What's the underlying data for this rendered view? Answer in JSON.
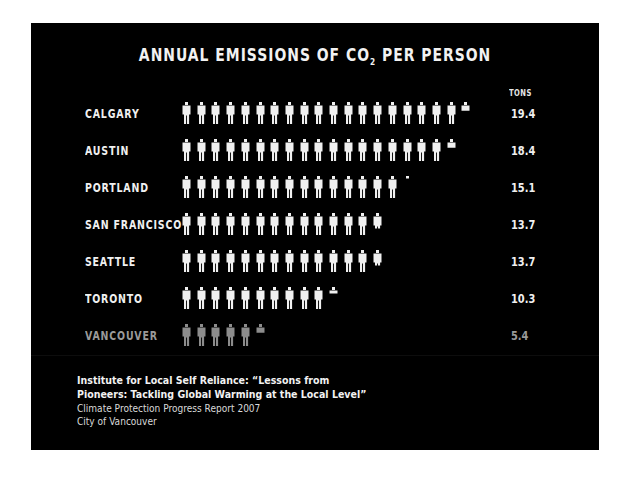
{
  "title": {
    "prefix": "ANNUAL EMISSIONS OF CO",
    "subscript": "2",
    "suffix": " PER PERSON"
  },
  "unit_label": "TONS",
  "rows": [
    {
      "city": "CALGARY",
      "value": "19.4",
      "full": 19,
      "partial": 0.4,
      "muted": false
    },
    {
      "city": "AUSTIN",
      "value": "18.4",
      "full": 18,
      "partial": 0.4,
      "muted": false
    },
    {
      "city": "PORTLAND",
      "value": "15.1",
      "full": 15,
      "partial": 0.1,
      "muted": false
    },
    {
      "city": "SAN FRANCISCO",
      "value": "13.7",
      "full": 13,
      "partial": 0.7,
      "muted": false
    },
    {
      "city": "SEATTLE",
      "value": "13.7",
      "full": 13,
      "partial": 0.7,
      "muted": false
    },
    {
      "city": "TORONTO",
      "value": "10.3",
      "full": 10,
      "partial": 0.3,
      "muted": false
    },
    {
      "city": "VANCOUVER",
      "value": "5.4",
      "full": 5,
      "partial": 0.4,
      "muted": true
    }
  ],
  "source": {
    "line1": "Institute for Local Self Reliance: “Lessons from",
    "line2": "Pioneers: Tackling Global Warming at the Local Level”",
    "line3": "Climate Protection Progress Report 2007",
    "line4": "City of Vancouver"
  },
  "colors": {
    "background": "#000000",
    "figure": "#f0f0f0",
    "figure_muted": "#8c8c8c",
    "text": "#f0f0f0",
    "text_muted": "#9a9a9a"
  },
  "chart_data": {
    "type": "bar",
    "title": "Annual Emissions of CO2 per Person",
    "xlabel": "",
    "ylabel": "Tons",
    "categories": [
      "Calgary",
      "Austin",
      "Portland",
      "San Francisco",
      "Seattle",
      "Toronto",
      "Vancouver"
    ],
    "values": [
      19.4,
      18.4,
      15.1,
      13.7,
      13.7,
      10.3,
      5.4
    ],
    "orientation": "horizontal",
    "style": "pictogram (1 person icon = 1 ton)",
    "highlight": "Vancouver (gray)",
    "source": "Institute for Local Self Reliance: “Lessons from Pioneers: Tackling Global Warming at the Local Level”; Climate Protection Progress Report 2007, City of Vancouver"
  }
}
